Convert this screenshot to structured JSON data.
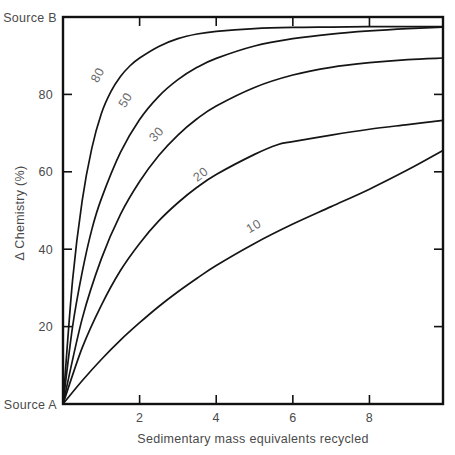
{
  "figure": {
    "background_color": "#ffffff",
    "frame_color": "#111111",
    "curve_color": "#151515",
    "label_color": "#4a4a4a",
    "curve_label_color": "#6b6b6b"
  },
  "axes": {
    "x_title": "Sedimentary mass equivalents recycled",
    "y_title": "Δ Chemistry  (%)",
    "x_ticks": [
      "2",
      "4",
      "6",
      "8"
    ],
    "y_ticks": [
      "20",
      "40",
      "60",
      "80"
    ],
    "y_bottom_label": "Source A",
    "y_top_label": "Source B"
  },
  "chart_data": {
    "type": "line",
    "title": "",
    "xlabel": "Sedimentary mass equivalents recycled",
    "ylabel": "Δ Chemistry (%)",
    "xlim": [
      0,
      9.92
    ],
    "ylim": [
      0,
      100
    ],
    "xticks": [
      2,
      4,
      6,
      8
    ],
    "yticks": [
      20,
      40,
      60,
      80
    ],
    "grid": false,
    "legend": "inline-curve-labels",
    "y_axis_endpoint_labels": {
      "bottom": "Source A",
      "top": "Source B"
    },
    "series": [
      {
        "name": "80",
        "label": "80",
        "label_x": 1.0,
        "label_y": 84.5,
        "x": [
          0,
          0.25,
          0.5,
          0.75,
          1.0,
          1.25,
          1.5,
          1.75,
          2.0,
          2.5,
          3.0,
          3.5,
          4.0,
          5.0,
          6.0,
          7.0,
          8.0,
          9.0,
          9.92
        ],
        "y": [
          0,
          32.0,
          52.5,
          66.0,
          75.0,
          80.7,
          84.6,
          87.4,
          89.4,
          92.4,
          94.4,
          95.6,
          96.3,
          97.0,
          97.3,
          97.4,
          97.5,
          97.5,
          97.5
        ]
      },
      {
        "name": "50",
        "label": "50",
        "label_x": 1.72,
        "label_y": 78.0,
        "x": [
          0,
          0.25,
          0.5,
          0.75,
          1.0,
          1.5,
          2.0,
          2.5,
          3.0,
          3.5,
          4.0,
          5.0,
          6.0,
          7.0,
          8.0,
          9.0,
          9.92
        ],
        "y": [
          0,
          20.0,
          34.0,
          45.0,
          53.0,
          65.0,
          73.5,
          79.5,
          83.8,
          87.0,
          89.3,
          92.5,
          94.4,
          95.6,
          96.4,
          97.0,
          97.4
        ]
      },
      {
        "name": "30",
        "label": "30",
        "label_x": 2.52,
        "label_y": 69.0,
        "x": [
          0,
          0.5,
          1.0,
          1.5,
          2.0,
          2.5,
          3.0,
          3.5,
          4.0,
          5.0,
          6.0,
          7.0,
          8.0,
          9.0,
          9.92
        ],
        "y": [
          0,
          22.0,
          37.5,
          49.0,
          57.5,
          64.2,
          69.5,
          73.7,
          77.0,
          81.8,
          85.0,
          87.0,
          88.2,
          89.0,
          89.4
        ]
      },
      {
        "name": "20",
        "label": "20",
        "label_x": 3.66,
        "label_y": 58.5,
        "x": [
          0,
          0.5,
          1.0,
          1.5,
          2.0,
          2.5,
          3.0,
          3.5,
          4.0,
          5.0,
          5.6,
          6.0,
          7.0,
          8.0,
          9.0,
          9.92
        ],
        "y": [
          0,
          14.5,
          25.5,
          34.5,
          41.5,
          47.3,
          52.0,
          56.0,
          59.3,
          64.5,
          67.0,
          67.8,
          69.5,
          71.0,
          72.2,
          73.3
        ]
      },
      {
        "name": "10",
        "label": "10",
        "label_x": 5.03,
        "label_y": 45.0,
        "x": [
          0,
          0.5,
          1.0,
          1.5,
          2.0,
          2.5,
          3.0,
          3.5,
          4.0,
          5.0,
          6.0,
          7.0,
          8.0,
          9.0,
          9.92
        ],
        "y": [
          0,
          6.0,
          11.5,
          16.5,
          21.0,
          25.2,
          29.0,
          32.5,
          35.8,
          41.5,
          46.5,
          51.0,
          55.5,
          60.5,
          65.5
        ]
      }
    ]
  }
}
